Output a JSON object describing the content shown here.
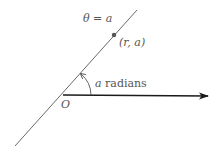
{
  "diagram": {
    "type": "polar-ray-diagram",
    "ray_label": "θ = a",
    "point_label": "(r, a)",
    "angle_label_var": "a",
    "angle_label_unit": " radians",
    "origin_label": "O",
    "colors": {
      "line": "#6a6a6a",
      "axis": "#1a1a1a",
      "text": "#555555",
      "point": "#555555"
    }
  }
}
